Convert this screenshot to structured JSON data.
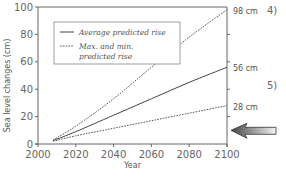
{
  "chart_data": {
    "type": "line",
    "title": "",
    "xlabel": "Year",
    "ylabel": "Sea level changes (cm)",
    "xlim": [
      2000,
      2100
    ],
    "ylim": [
      0,
      100
    ],
    "x_ticks": [
      "2000",
      "2020",
      "2040",
      "2060",
      "2080",
      "2100"
    ],
    "y_ticks": [
      "0",
      "20",
      "40",
      "60",
      "80",
      "100"
    ],
    "grid": false,
    "legend_position": "upper left",
    "x": [
      2008,
      2020,
      2040,
      2060,
      2080,
      2100
    ],
    "series": [
      {
        "name": "Max. predicted rise",
        "style": "dotted",
        "values": [
          3,
          13,
          33,
          56,
          78,
          98
        ]
      },
      {
        "name": "Average predicted rise",
        "style": "solid",
        "values": [
          2.5,
          9,
          21,
          33,
          45,
          56
        ]
      },
      {
        "name": "Min. predicted rise",
        "style": "dotted",
        "values": [
          2,
          6,
          11.5,
          17,
          22.5,
          28
        ]
      }
    ],
    "legend": [
      {
        "label": "Average predicted rise",
        "style": "solid"
      },
      {
        "label": "Max. and min.",
        "label2": "predicted rise",
        "style": "dotted"
      }
    ],
    "annotations": [
      {
        "text": "98 cm",
        "y": 98
      },
      {
        "text": "56 cm",
        "y": 56
      },
      {
        "text": "28 cm",
        "y": 28
      },
      {
        "text": "4)",
        "y": 98
      },
      {
        "text": "5)",
        "y": 43
      }
    ],
    "arrow": {
      "direction": "left",
      "y": 10,
      "color": "#888888"
    }
  }
}
